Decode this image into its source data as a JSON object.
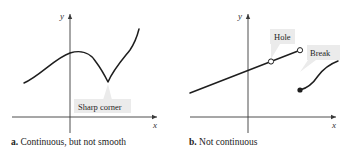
{
  "figure": {
    "panels": [
      {
        "id": "a",
        "caption_letter": "a.",
        "caption_text": "Continuous, but not smooth",
        "axes": {
          "x_label": "x",
          "y_label": "y"
        },
        "callouts": [
          {
            "label": "Sharp corner"
          }
        ]
      },
      {
        "id": "b",
        "caption_letter": "b.",
        "caption_text": "Not continuous",
        "axes": {
          "x_label": "x",
          "y_label": "y"
        },
        "callouts": [
          {
            "label": "Hole"
          },
          {
            "label": "Break"
          }
        ]
      }
    ],
    "colors": {
      "curve": "#1e1e1e",
      "axis": "#3a3a3a",
      "callout_fill": "#ebebeb",
      "background": "#ffffff"
    }
  }
}
